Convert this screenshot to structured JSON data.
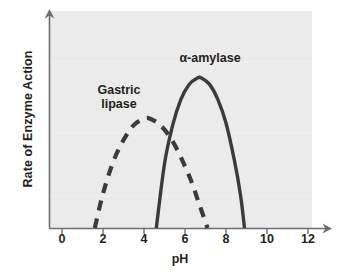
{
  "chart_data": {
    "type": "line",
    "title": "",
    "xlabel": "pH",
    "ylabel": "Rate of Enzyme Action",
    "xlim": [
      0,
      13
    ],
    "ylim": [
      0,
      1
    ],
    "xticks": [
      0,
      2,
      4,
      6,
      8,
      10,
      12
    ],
    "xtick_labels": [
      "0",
      "2",
      "4",
      "6",
      "8",
      "10",
      "12"
    ],
    "yticks": [],
    "ytick_labels": [],
    "grid": false,
    "legend_position": "inline-annotations",
    "background_color": "#ebebeb",
    "axis_color": "#6d6e71",
    "series": [
      {
        "name": "Gastric lipase",
        "style": "dashed",
        "color": "#3b3b3b",
        "label_text": "Gastric\nlipase",
        "ph_start": 1.6,
        "ph_peak": 4.3,
        "ph_end": 7.1,
        "peak_rate": 0.51,
        "x": [
          1.6,
          2.0,
          2.5,
          3.0,
          3.5,
          4.0,
          4.3,
          4.8,
          5.3,
          5.8,
          6.3,
          6.7,
          7.1
        ],
        "y": [
          0.0,
          0.16,
          0.31,
          0.41,
          0.48,
          0.51,
          0.51,
          0.48,
          0.42,
          0.33,
          0.22,
          0.11,
          0.0
        ]
      },
      {
        "name": "α-amylase",
        "style": "solid",
        "color": "#3b3b3b",
        "label_text": "α-amylase",
        "ph_start": 4.6,
        "ph_peak": 6.8,
        "ph_end": 8.9,
        "peak_rate": 0.7,
        "x": [
          4.6,
          5.0,
          5.4,
          5.8,
          6.2,
          6.6,
          6.8,
          7.2,
          7.6,
          8.0,
          8.4,
          8.7,
          8.9
        ],
        "y": [
          0.0,
          0.3,
          0.48,
          0.6,
          0.67,
          0.7,
          0.7,
          0.67,
          0.6,
          0.49,
          0.32,
          0.16,
          0.0
        ]
      }
    ]
  },
  "axes": {
    "x_title": "pH",
    "y_title": "Rate of Enzyme Action"
  },
  "annotations": {
    "amylase": "α-amylase",
    "lipase": "Gastric\nlipase"
  },
  "ticks": {
    "labels": [
      "0",
      "2",
      "4",
      "6",
      "8",
      "10",
      "12"
    ]
  }
}
